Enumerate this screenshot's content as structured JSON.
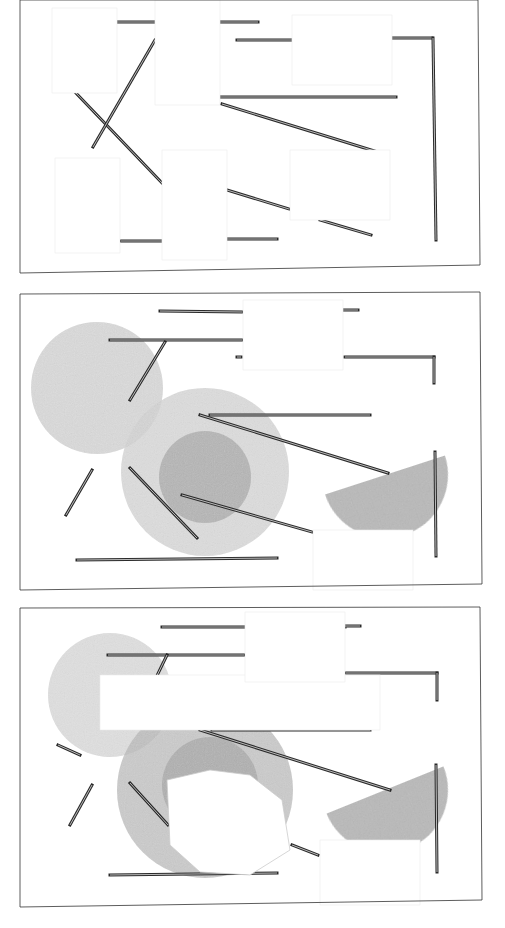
{
  "canvas": {
    "width": 505,
    "height": 928,
    "background": "#ffffff"
  },
  "colors": {
    "frame": "#333333",
    "rod_dark": "#2a2a2a",
    "rod_light": "#bbbbbb",
    "circle_light": "#d4d4d4",
    "circle_mid": "#b8b8b8",
    "circle_dark": "#a6a6a6",
    "paper": "#ffffff",
    "paper_edge": "#ececec"
  },
  "panels": [
    {
      "name": "panel-1-lines",
      "frame": [
        [
          20,
          0
        ],
        [
          478,
          0
        ],
        [
          480,
          265
        ],
        [
          20,
          273
        ]
      ],
      "frame_ticks": [
        [
          15,
          273,
          480,
          265
        ]
      ],
      "circles": [],
      "paper_patches": [
        [
          52,
          8,
          65,
          85
        ],
        [
          155,
          0,
          65,
          105
        ],
        [
          292,
          15,
          100,
          70
        ],
        [
          55,
          158,
          65,
          95
        ],
        [
          162,
          150,
          65,
          110
        ],
        [
          290,
          150,
          100,
          70
        ]
      ],
      "rods": [
        [
          117,
          22,
          155,
          22
        ],
        [
          220,
          22,
          258,
          22
        ],
        [
          237,
          40,
          292,
          40
        ],
        [
          392,
          38,
          432,
          38
        ],
        [
          433,
          38,
          436,
          240
        ],
        [
          220,
          97,
          396,
          97
        ],
        [
          222,
          104,
          381,
          153
        ],
        [
          75,
          92,
          162,
          183
        ],
        [
          155,
          40,
          93,
          147
        ],
        [
          227,
          190,
          289,
          209
        ],
        [
          320,
          220,
          371,
          235
        ],
        [
          121,
          241,
          162,
          241
        ],
        [
          227,
          239,
          277,
          239
        ]
      ]
    },
    {
      "name": "panel-2-circles",
      "frame": [
        [
          20,
          294
        ],
        [
          480,
          292
        ],
        [
          482,
          584
        ],
        [
          20,
          590
        ]
      ],
      "frame_ticks": [],
      "circles": [
        {
          "cx": 97,
          "cy": 388,
          "r": 66,
          "fill": "circle_light",
          "opacity": 0.85
        },
        {
          "cx": 205,
          "cy": 472,
          "r": 84,
          "fill": "circle_light",
          "opacity": 0.8
        },
        {
          "cx": 205,
          "cy": 477,
          "r": 46,
          "fill": "circle_dark",
          "opacity": 0.7
        }
      ],
      "half_discs": [
        {
          "cx": 385,
          "cy": 475,
          "r": 63,
          "rotate": -18
        }
      ],
      "paper_patches": [
        [
          243,
          300,
          100,
          70
        ],
        [
          313,
          530,
          100,
          60
        ]
      ],
      "rods": [
        [
          160,
          311,
          242,
          312
        ],
        [
          342,
          310,
          358,
          310
        ],
        [
          110,
          340,
          242,
          340
        ],
        [
          237,
          357,
          241,
          357
        ],
        [
          345,
          357,
          434,
          357
        ],
        [
          434,
          357,
          434,
          383
        ],
        [
          210,
          415,
          370,
          415
        ],
        [
          200,
          415,
          388,
          473
        ],
        [
          165,
          342,
          130,
          400
        ],
        [
          92,
          470,
          66,
          515
        ],
        [
          130,
          468,
          197,
          538
        ],
        [
          182,
          495,
          312,
          532
        ],
        [
          77,
          560,
          277,
          558
        ],
        [
          435,
          452,
          436,
          556
        ]
      ]
    },
    {
      "name": "panel-3-torn",
      "frame": [
        [
          20,
          608
        ],
        [
          480,
          607
        ],
        [
          482,
          900
        ],
        [
          20,
          907
        ]
      ],
      "frame_ticks": [],
      "circles": [
        {
          "cx": 110,
          "cy": 695,
          "r": 62,
          "fill": "circle_light",
          "opacity": 0.75
        },
        {
          "cx": 205,
          "cy": 790,
          "r": 88,
          "fill": "circle_mid",
          "opacity": 0.75
        },
        {
          "cx": 210,
          "cy": 785,
          "r": 48,
          "fill": "circle_dark",
          "opacity": 0.7
        }
      ],
      "half_discs": [
        {
          "cx": 385,
          "cy": 790,
          "r": 63,
          "rotate": -22
        }
      ],
      "paper_patches": [
        [
          100,
          675,
          280,
          55
        ],
        [
          245,
          612,
          100,
          70
        ],
        [
          320,
          840,
          100,
          65
        ]
      ],
      "torn_paper": [
        [
          167,
          780
        ],
        [
          210,
          770
        ],
        [
          250,
          775
        ],
        [
          282,
          800
        ],
        [
          290,
          850
        ],
        [
          250,
          875
        ],
        [
          200,
          872
        ],
        [
          170,
          845
        ]
      ],
      "rods": [
        [
          162,
          627,
          345,
          627
        ],
        [
          345,
          626,
          360,
          626
        ],
        [
          108,
          655,
          244,
          655
        ],
        [
          346,
          673,
          437,
          673
        ],
        [
          437,
          673,
          437,
          700
        ],
        [
          212,
          730,
          370,
          730
        ],
        [
          200,
          730,
          390,
          790
        ],
        [
          167,
          655,
          150,
          690
        ],
        [
          58,
          745,
          80,
          755
        ],
        [
          92,
          785,
          70,
          825
        ],
        [
          130,
          783,
          168,
          825
        ],
        [
          292,
          845,
          318,
          855
        ],
        [
          110,
          875,
          277,
          873
        ],
        [
          436,
          765,
          437,
          872
        ]
      ]
    }
  ]
}
